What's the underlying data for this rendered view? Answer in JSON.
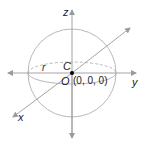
{
  "diagram": {
    "labels": {
      "z_axis": "z",
      "y_axis": "y",
      "x_axis": "x",
      "radius": "r",
      "center": "C",
      "origin": "O",
      "origin_coords": "(0, 0, 0)"
    },
    "colors": {
      "lines": "#a6a6a6",
      "axes": "#9a9a9a",
      "text": "#222222",
      "center_point": "#000000"
    }
  }
}
